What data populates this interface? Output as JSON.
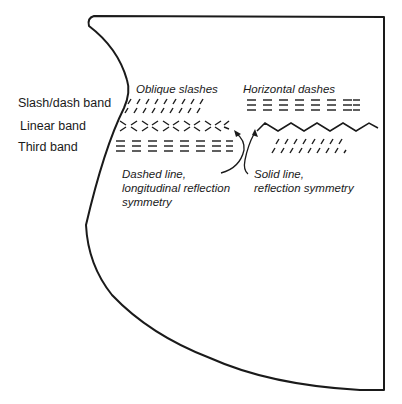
{
  "diagram": {
    "band_labels": {
      "slash_dash": "Slash/dash band",
      "linear": "Linear band",
      "third": "Third band"
    },
    "annotations": {
      "oblique": "Oblique slashes",
      "horizontal": "Horizontal dashes",
      "dashed_line": [
        "Dashed line,",
        "longitudinal reflection",
        "symmetry"
      ],
      "solid_line": [
        "Solid line,",
        "reflection symmetry"
      ]
    },
    "colors": {
      "stroke": "#1a1a1a",
      "background": "#ffffff"
    }
  }
}
